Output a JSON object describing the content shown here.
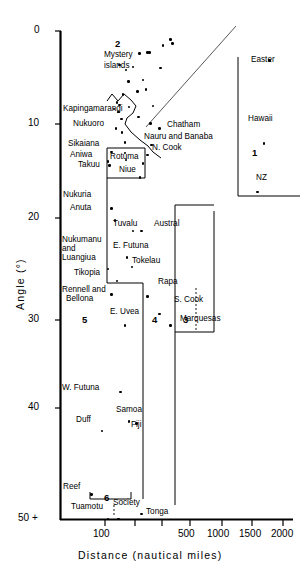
{
  "chart_data": {
    "type": "scatter",
    "title": "",
    "xlabel": "Distance (nautical miles)",
    "ylabel": "Angle (°)",
    "x_scale": "log",
    "x_ticks": [
      100,
      500,
      1000,
      1500,
      2000
    ],
    "x_tick_labels": [
      "100",
      "500",
      "1000",
      "1500",
      "2000"
    ],
    "y_ticks": [
      0,
      10,
      20,
      30,
      40,
      50
    ],
    "y_tick_labels": [
      "0",
      "10",
      "20",
      "30",
      "40",
      "50 +"
    ],
    "ylim": [
      0,
      50
    ],
    "grid": false,
    "legend": "none",
    "annotations": [
      {
        "text": "Mystery islands",
        "region": "2"
      },
      {
        "text": "Kapingamarangi"
      },
      {
        "text": "Nukuoro"
      },
      {
        "text": "Sikaiana"
      },
      {
        "text": "Aniwa"
      },
      {
        "text": "Takuu"
      },
      {
        "text": "Rotuma"
      },
      {
        "text": "Niue"
      },
      {
        "text": "Nauru and Banaba"
      },
      {
        "text": "N. Cook"
      },
      {
        "text": "Chatham"
      },
      {
        "text": "Easter"
      },
      {
        "text": "Hawaii"
      },
      {
        "text": "NZ"
      },
      {
        "text": "Nukuria"
      },
      {
        "text": "Anuta"
      },
      {
        "text": "Tuvalu"
      },
      {
        "text": "Austral"
      },
      {
        "text": "Nukumanu and Luangiua"
      },
      {
        "text": "E. Futuna"
      },
      {
        "text": "Tokelau"
      },
      {
        "text": "Tikopia"
      },
      {
        "text": "Rapa"
      },
      {
        "text": "Rennell and Bellona"
      },
      {
        "text": "S. Cook"
      },
      {
        "text": "E. Uvea"
      },
      {
        "text": "Marquesas"
      },
      {
        "text": "W. Futuna"
      },
      {
        "text": "Samoa"
      },
      {
        "text": "Duff"
      },
      {
        "text": "Fiji"
      },
      {
        "text": "Reef"
      },
      {
        "text": "Tuamotu"
      },
      {
        "text": "Society"
      },
      {
        "text": "Tonga"
      }
    ],
    "regions": [
      "1",
      "2",
      "3",
      "4",
      "5",
      "6"
    ],
    "named_points": [
      {
        "label": "Easter",
        "distance": 1600,
        "angle": 3.0
      },
      {
        "label": "Hawaii",
        "distance": 1450,
        "angle": 11.5
      },
      {
        "label": "NZ",
        "distance": 1300,
        "angle": 16.5
      },
      {
        "label": "Chatham",
        "distance": 250,
        "angle": 10.0
      },
      {
        "label": "Nauru and Banaba",
        "distance": 218,
        "angle": 11.7
      },
      {
        "label": "N. Cook",
        "distance": 205,
        "angle": 12.7
      },
      {
        "label": "Nukuoro",
        "distance": 120,
        "angle": 10.0
      },
      {
        "label": "Sikaiana",
        "distance": 112,
        "angle": 12.4
      },
      {
        "label": "Aniwa",
        "distance": 105,
        "angle": 13.4
      },
      {
        "label": "Takuu",
        "distance": 108,
        "angle": 13.8
      },
      {
        "label": "Rotuma",
        "distance": 190,
        "angle": 13.6
      },
      {
        "label": "Niue",
        "distance": 180,
        "angle": 15.0
      },
      {
        "label": "Nukuria",
        "distance": 112,
        "angle": 18.2
      },
      {
        "label": "Anuta",
        "distance": 118,
        "angle": 19.4
      },
      {
        "label": "Tuvalu",
        "distance": 160,
        "angle": 20.5
      },
      {
        "label": "Austral",
        "distance": 185,
        "angle": 20.5
      },
      {
        "label": "E. Futuna",
        "distance": 145,
        "angle": 23.2
      },
      {
        "label": "Tokelau",
        "distance": 158,
        "angle": 24.2
      },
      {
        "label": "Nukumanu and Luangiua",
        "distance": 105,
        "angle": 24.4
      },
      {
        "label": "Tikopia",
        "distance": 122,
        "angle": 25.6
      },
      {
        "label": "Rennell and Bellona",
        "distance": 112,
        "angle": 27.0
      },
      {
        "label": "Rapa",
        "distance": 205,
        "angle": 27.2
      },
      {
        "label": "S. Cook",
        "distance": 250,
        "angle": 29.0
      },
      {
        "label": "E. Uvea",
        "distance": 140,
        "angle": 30.2
      },
      {
        "label": "Marquesas",
        "distance": 300,
        "angle": 30.2
      },
      {
        "label": "W. Futuna",
        "distance": 130,
        "angle": 37.0
      },
      {
        "label": "Samoa",
        "distance": 150,
        "angle": 40.0
      },
      {
        "label": "Fiji",
        "distance": 170,
        "angle": 40.2
      },
      {
        "label": "Duff",
        "distance": 95,
        "angle": 41.0
      },
      {
        "label": "Reef",
        "distance": 80,
        "angle": 47.5
      },
      {
        "label": "Tuamotu",
        "distance": 105,
        "angle": 50.0
      },
      {
        "label": "Society",
        "distance": 125,
        "angle": 50.0
      },
      {
        "label": "Tonga",
        "distance": 185,
        "angle": 49.5
      }
    ],
    "mystery_island_points": [
      {
        "distance": 128,
        "angle": 3.5
      },
      {
        "distance": 142,
        "angle": 4.0
      },
      {
        "distance": 178,
        "angle": 2.3
      },
      {
        "distance": 205,
        "angle": 2.2
      },
      {
        "distance": 212,
        "angle": 2.2
      },
      {
        "distance": 265,
        "angle": 1.5
      },
      {
        "distance": 300,
        "angle": 0.9
      },
      {
        "distance": 310,
        "angle": 1.3
      },
      {
        "distance": 160,
        "angle": 3.7
      },
      {
        "distance": 190,
        "angle": 5.0
      },
      {
        "distance": 148,
        "angle": 5.2
      },
      {
        "distance": 255,
        "angle": 3.8
      },
      {
        "distance": 172,
        "angle": 6.2
      },
      {
        "distance": 200,
        "angle": 6.0
      },
      {
        "distance": 135,
        "angle": 6.5
      },
      {
        "distance": 128,
        "angle": 7.6
      },
      {
        "distance": 150,
        "angle": 7.8
      },
      {
        "distance": 225,
        "angle": 7.7
      },
      {
        "distance": 132,
        "angle": 9.0
      },
      {
        "distance": 175,
        "angle": 8.8
      },
      {
        "distance": 215,
        "angle": 9.5
      },
      {
        "distance": 133,
        "angle": 10.4
      },
      {
        "distance": 140,
        "angle": 11.4
      },
      {
        "distance": 140,
        "angle": 12.5
      },
      {
        "distance": 142,
        "angle": 13.2
      },
      {
        "distance": 122,
        "angle": 7.3
      },
      {
        "distance": 116,
        "angle": 8.0
      },
      {
        "distance": 126,
        "angle": 8.3
      }
    ]
  },
  "axes": {
    "x_title": "Distance (nautical miles)",
    "y_title": "Angle (°)",
    "x_labels": [
      "100",
      "500",
      "1000",
      "1500",
      "2000"
    ],
    "y_labels": [
      "0",
      "10",
      "20",
      "30",
      "40",
      "50 +"
    ]
  },
  "point_labels": {
    "mystery": "Mystery",
    "islands": "islands",
    "kapingamarangi": "Kapingamarangi",
    "nukuoro": "Nukuoro",
    "sikaiana": "Sikaiana",
    "aniwa": "Aniwa",
    "takuu": "Takuu",
    "rotuma": "Rotuma",
    "niue": "Niue",
    "nauru": "Nauru and Banaba",
    "ncook": "N. Cook",
    "chatham": "Chatham",
    "easter": "Easter",
    "hawaii": "Hawaii",
    "nz": "NZ",
    "nukuria": "Nukuria",
    "anuta": "Anuta",
    "tuvalu": "Tuvalu",
    "austral": "Austral",
    "nukumanu1": "Nukumanu",
    "nukumanu2": "and",
    "nukumanu3": "Luangiua",
    "efutuna": "E. Futuna",
    "tokelau": "Tokelau",
    "tikopia": "Tikopia",
    "rapa": "Rapa",
    "rennell1": "Rennell and",
    "rennell2": "Bellona",
    "scook": "S. Cook",
    "euvea": "E. Uvea",
    "marquesas": "Marquesas",
    "wfutuna": "W. Futuna",
    "samoa": "Samoa",
    "duff": "Duff",
    "fiji": "Fiji",
    "reef": "Reef",
    "tuamotu": "Tuamotu",
    "society": "Society",
    "tonga": "Tonga"
  },
  "regions": {
    "r1": "1",
    "r2": "2",
    "r3": "3",
    "r4": "4",
    "r5": "5",
    "r6": "6"
  },
  "colors": {
    "ink": "#000000",
    "background": "#ffffff"
  }
}
